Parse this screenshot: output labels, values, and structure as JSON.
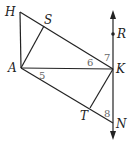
{
  "diagram": {
    "points": {
      "H": "H",
      "S": "S",
      "A": "A",
      "K": "K",
      "T": "T",
      "N": "N",
      "R": "R"
    },
    "angles": {
      "a5": "5",
      "a6": "6",
      "a7": "7",
      "a8": "8"
    },
    "segments": [
      "HA",
      "HK",
      "AS",
      "AK",
      "AN",
      "KT",
      "RN (line)"
    ],
    "colors": {
      "line": "#222222",
      "angle_label": "#666666",
      "background": "#ffffff"
    }
  }
}
